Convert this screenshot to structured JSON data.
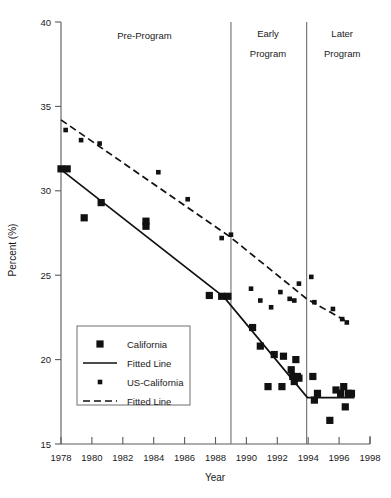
{
  "chart_data": {
    "type": "scatter",
    "title": "",
    "xlabel": "Year",
    "ylabel": "Percent (%)",
    "xlim": [
      1978,
      1998
    ],
    "ylim": [
      15,
      40
    ],
    "grid": false,
    "xticks": [
      1978,
      1980,
      1982,
      1984,
      1986,
      1988,
      1990,
      1992,
      1994,
      1996,
      1998
    ],
    "xtick_labels": [
      "1978",
      "1980",
      "1982",
      "1984",
      "1986",
      "1988",
      "1990",
      "1992",
      "1994",
      "1996",
      "1998"
    ],
    "yticks": [
      15,
      20,
      25,
      30,
      35,
      40
    ],
    "ytick_labels": [
      "15",
      "20",
      "25",
      "30",
      "35",
      "40"
    ],
    "legend_position": "lower-left-inside",
    "annotations": [
      {
        "text": "Pre-Program",
        "x": 1983.4,
        "y": 39.2
      },
      {
        "text": "Early",
        "x": 1991.4,
        "y": 39.3
      },
      {
        "text": "Program",
        "x": 1991.4,
        "y": 38.1
      },
      {
        "text": "Later",
        "x": 1996.2,
        "y": 39.3
      },
      {
        "text": "Program",
        "x": 1996.2,
        "y": 38.1
      }
    ],
    "vertical_dividers": [
      1989.0,
      1993.9
    ],
    "series": [
      {
        "name": "California",
        "marker": "large-square",
        "points": [
          {
            "x": 1978.0,
            "y": 31.3
          },
          {
            "x": 1978.4,
            "y": 31.3
          },
          {
            "x": 1979.5,
            "y": 28.4
          },
          {
            "x": 1980.6,
            "y": 29.3
          },
          {
            "x": 1983.5,
            "y": 27.9
          },
          {
            "x": 1983.5,
            "y": 28.2
          },
          {
            "x": 1987.6,
            "y": 23.8
          },
          {
            "x": 1988.4,
            "y": 23.75
          },
          {
            "x": 1988.8,
            "y": 23.75
          },
          {
            "x": 1990.4,
            "y": 21.9
          },
          {
            "x": 1990.9,
            "y": 20.8
          },
          {
            "x": 1991.4,
            "y": 18.4
          },
          {
            "x": 1991.8,
            "y": 20.3
          },
          {
            "x": 1992.3,
            "y": 18.4
          },
          {
            "x": 1992.4,
            "y": 20.2
          },
          {
            "x": 1992.9,
            "y": 19.4
          },
          {
            "x": 1993.0,
            "y": 19.0
          },
          {
            "x": 1993.1,
            "y": 18.7
          },
          {
            "x": 1993.2,
            "y": 20.0
          },
          {
            "x": 1993.3,
            "y": 19.0
          },
          {
            "x": 1993.4,
            "y": 18.9
          },
          {
            "x": 1994.3,
            "y": 19.0
          },
          {
            "x": 1994.4,
            "y": 17.6
          },
          {
            "x": 1994.6,
            "y": 18.0
          },
          {
            "x": 1995.4,
            "y": 16.4
          },
          {
            "x": 1995.8,
            "y": 18.2
          },
          {
            "x": 1996.1,
            "y": 18.0
          },
          {
            "x": 1996.3,
            "y": 18.4
          },
          {
            "x": 1996.4,
            "y": 17.2
          },
          {
            "x": 1996.6,
            "y": 18.0
          },
          {
            "x": 1996.8,
            "y": 18.0
          }
        ]
      },
      {
        "name": "US-California",
        "marker": "small-square",
        "points": [
          {
            "x": 1978.3,
            "y": 33.6
          },
          {
            "x": 1979.3,
            "y": 33.0
          },
          {
            "x": 1980.5,
            "y": 32.8
          },
          {
            "x": 1984.3,
            "y": 31.1
          },
          {
            "x": 1986.2,
            "y": 29.5
          },
          {
            "x": 1988.4,
            "y": 27.2
          },
          {
            "x": 1989.0,
            "y": 27.4
          },
          {
            "x": 1990.3,
            "y": 24.2
          },
          {
            "x": 1990.9,
            "y": 23.5
          },
          {
            "x": 1991.6,
            "y": 23.1
          },
          {
            "x": 1992.2,
            "y": 24.0
          },
          {
            "x": 1992.8,
            "y": 23.6
          },
          {
            "x": 1993.1,
            "y": 23.5
          },
          {
            "x": 1993.4,
            "y": 24.5
          },
          {
            "x": 1994.2,
            "y": 24.9
          },
          {
            "x": 1994.4,
            "y": 23.4
          },
          {
            "x": 1995.6,
            "y": 23.0
          },
          {
            "x": 1996.2,
            "y": 22.4
          },
          {
            "x": 1996.5,
            "y": 22.2
          }
        ]
      }
    ],
    "fitted_lines": [
      {
        "name": "California Fitted Line",
        "style": "solid",
        "vertices": [
          {
            "x": 1978.0,
            "y": 31.25
          },
          {
            "x": 1988.55,
            "y": 23.7
          },
          {
            "x": 1993.95,
            "y": 17.75
          },
          {
            "x": 1997.0,
            "y": 17.75
          }
        ]
      },
      {
        "name": "US-California Fitted Line",
        "style": "dashed",
        "vertices": [
          {
            "x": 1978.0,
            "y": 34.2
          },
          {
            "x": 1988.9,
            "y": 27.3
          },
          {
            "x": 1993.9,
            "y": 23.6
          },
          {
            "x": 1996.6,
            "y": 22.2
          }
        ]
      }
    ],
    "legend": {
      "entries": [
        {
          "label": "California",
          "marker": "large-square",
          "type": "marker"
        },
        {
          "label": "Fitted Line",
          "marker": "solid-line",
          "type": "line"
        },
        {
          "label": "US-California",
          "marker": "small-square",
          "type": "marker"
        },
        {
          "label": "Fitted Line",
          "marker": "dashed-line",
          "type": "line"
        }
      ]
    },
    "colors": {
      "marker": "#111111",
      "line": "#111111",
      "axis": "#5a5a5a",
      "divider": "#6e6e6e",
      "background": "#ffffff"
    }
  }
}
